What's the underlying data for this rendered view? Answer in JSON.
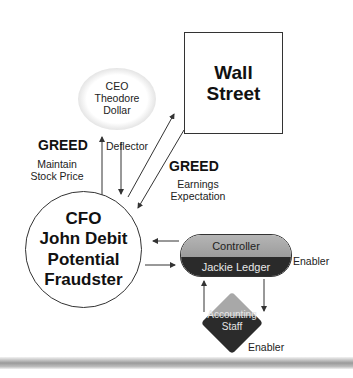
{
  "diagram": {
    "nodes": {
      "ceo": {
        "lines": [
          "CEO",
          "Theodore",
          "Dollar"
        ],
        "shape": "ellipse"
      },
      "wall_street": {
        "lines": [
          "Wall",
          "Street"
        ],
        "shape": "rectangle"
      },
      "cfo": {
        "lines": [
          "CFO",
          "John Debit",
          "Potential",
          "Fraudster"
        ],
        "shape": "circle"
      },
      "controller": {
        "title": "Controller",
        "name": "Jackie Ledger",
        "shape": "pill"
      },
      "accounting_staff": {
        "lines": [
          "Accounting",
          "Staff"
        ],
        "shape": "diamond"
      }
    },
    "labels": {
      "greed_left": "GREED",
      "maintain_stock_price": [
        "Maintain",
        "Stock Price"
      ],
      "deflector": "Deflector",
      "greed_right": "GREED",
      "earnings_expectation": [
        "Earnings",
        "Expectation"
      ],
      "enabler_controller": "Enabler",
      "enabler_staff": "Enabler"
    },
    "edges": [
      {
        "from": "cfo",
        "to": "ceo",
        "label": "Maintain Stock Price"
      },
      {
        "from": "ceo",
        "to": "cfo",
        "label": "Deflector"
      },
      {
        "from": "cfo",
        "to": "wall_street",
        "label": ""
      },
      {
        "from": "wall_street",
        "to": "cfo",
        "label": "Earnings Expectation"
      },
      {
        "from": "controller",
        "to": "cfo",
        "label": ""
      },
      {
        "from": "cfo",
        "to": "controller",
        "label": ""
      },
      {
        "from": "controller",
        "to": "accounting_staff",
        "label": ""
      },
      {
        "from": "accounting_staff",
        "to": "controller",
        "label": ""
      }
    ],
    "colors": {
      "line": "#333333",
      "pill_top": "#a8a8a8",
      "pill_bottom": "#2a2a2a",
      "diamond_top": "#a8a8a8",
      "diamond_bottom": "#2b2b2b"
    }
  }
}
